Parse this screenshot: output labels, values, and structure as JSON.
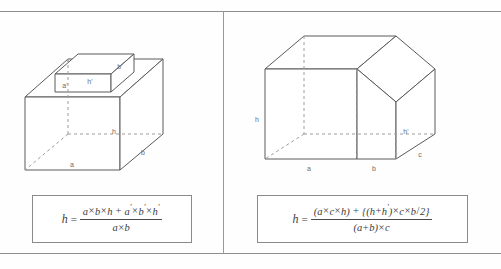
{
  "page": {
    "background_color": "#fefefe",
    "line_color": "#5a5a5a",
    "hidden_line_color": "#9c9c9c",
    "label_color": "#6b6b6b"
  },
  "panels": [
    {
      "id": "left",
      "figure": {
        "name": "stepped-box-diagram",
        "description": "Large rectangular box with a smaller rectangular box centered on its top face",
        "labels": [
          {
            "key": "a_prime",
            "text": "a'",
            "target": "small box front width"
          },
          {
            "key": "h_prime",
            "text": "h'",
            "target": "small box height"
          },
          {
            "key": "b_prime",
            "text": "b'",
            "target": "small box depth"
          },
          {
            "key": "h",
            "text": "h",
            "target": "large box height"
          },
          {
            "key": "a",
            "text": "a",
            "target": "large box front width"
          },
          {
            "key": "b",
            "text": "b",
            "target": "large box depth"
          }
        ]
      },
      "formula": {
        "name": "stepped-box-formula",
        "lhs": "h",
        "relation": "=",
        "numerator": "a×b×h + a'×b'×h'",
        "denominator": "a×b",
        "plain_text": "h = (a×b×h + a'×b'×h') / (a×b)",
        "numerator_parts": [
          {
            "t": "a"
          },
          {
            "t": "×",
            "op": true
          },
          {
            "t": "b"
          },
          {
            "t": "×",
            "op": true
          },
          {
            "t": "h"
          },
          {
            "t": " + ",
            "op": true
          },
          {
            "t": "a"
          },
          {
            "t": "'",
            "prime": true
          },
          {
            "t": "×",
            "op": true
          },
          {
            "t": "b"
          },
          {
            "t": "'",
            "prime": true
          },
          {
            "t": "×",
            "op": true
          },
          {
            "t": "h"
          },
          {
            "t": "'",
            "prime": true
          }
        ],
        "denominator_parts": [
          {
            "t": "a"
          },
          {
            "t": "×",
            "op": true
          },
          {
            "t": "b"
          }
        ]
      }
    },
    {
      "id": "right",
      "figure": {
        "name": "sloped-roof-prism-diagram",
        "description": "Prism with a flat top over span a+b on the left and a sloped roof face dropping to height h' over span c on the right",
        "labels": [
          {
            "key": "h",
            "text": "h",
            "target": "full height at left face"
          },
          {
            "key": "h_prime",
            "text": "h'",
            "target": "reduced height under sloped face"
          },
          {
            "key": "a",
            "text": "a",
            "target": "bottom front first span"
          },
          {
            "key": "b",
            "text": "b",
            "target": "bottom front second span"
          },
          {
            "key": "c",
            "text": "c",
            "target": "depth / right span"
          }
        ]
      },
      "formula": {
        "name": "sloped-roof-prism-formula",
        "lhs": "h",
        "relation": "=",
        "numerator": "(a×c×h) + {(h+h')×c×b/2}",
        "denominator": "(a+b)×c",
        "plain_text": "h = ((a×c×h) + {(h+h')×c×b/2}) / ((a+b)×c)",
        "numerator_parts": [
          {
            "t": "("
          },
          {
            "t": "a"
          },
          {
            "t": "×",
            "op": true
          },
          {
            "t": "c"
          },
          {
            "t": "×",
            "op": true
          },
          {
            "t": "h"
          },
          {
            "t": ")"
          },
          {
            "t": " + ",
            "op": true
          },
          {
            "t": "{"
          },
          {
            "t": "("
          },
          {
            "t": "h"
          },
          {
            "t": "+",
            "op": true
          },
          {
            "t": "h"
          },
          {
            "t": "'",
            "prime": true
          },
          {
            "t": ")"
          },
          {
            "t": "×",
            "op": true
          },
          {
            "t": "c"
          },
          {
            "t": "×",
            "op": true
          },
          {
            "t": "b"
          },
          {
            "t": "/",
            "op": true
          },
          {
            "t": "2"
          },
          {
            "t": "}"
          }
        ],
        "denominator_parts": [
          {
            "t": "("
          },
          {
            "t": "a"
          },
          {
            "t": "+",
            "op": true
          },
          {
            "t": "b"
          },
          {
            "t": ")"
          },
          {
            "t": "×",
            "op": true
          },
          {
            "t": "c"
          }
        ]
      }
    }
  ]
}
